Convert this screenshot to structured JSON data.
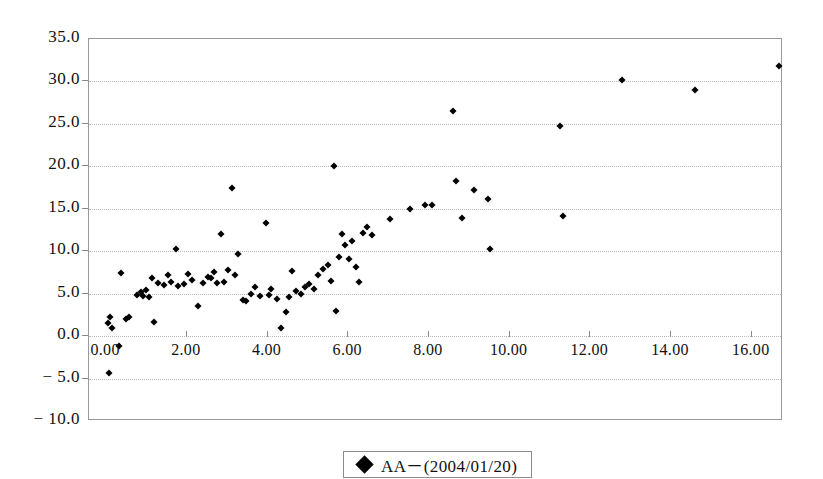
{
  "chart_data": {
    "type": "scatter",
    "title": "",
    "xlabel": "",
    "ylabel": "",
    "xlim": [
      -0.4,
      16.8
    ],
    "ylim": [
      -10.0,
      35.0
    ],
    "grid": true,
    "legend_position": "bottom-center",
    "x_ticks": [
      "0.00",
      "2.00",
      "4.00",
      "6.00",
      "8.00",
      "10.00",
      "12.00",
      "14.00",
      "16.00"
    ],
    "x_tick_values": [
      0,
      2,
      4,
      6,
      8,
      10,
      12,
      14,
      16
    ],
    "y_ticks": [
      "35.0",
      "30.0",
      "25.0",
      "20.0",
      "15.0",
      "10.0",
      "5.0",
      "0.0",
      "− 5.0",
      "− 10.0"
    ],
    "y_tick_values": [
      35,
      30,
      25,
      20,
      15,
      10,
      5,
      0,
      -5,
      -10
    ],
    "marker": "diamond",
    "marker_color": "#000000",
    "grid_color": "#b9b9b9",
    "frame_color": "#9a9a9a",
    "series": [
      {
        "name": "AA－(2004/01/20)",
        "points": [
          [
            0.08,
            1.6
          ],
          [
            0.12,
            2.2
          ],
          [
            0.1,
            -4.4
          ],
          [
            0.18,
            0.9
          ],
          [
            0.35,
            -1.2
          ],
          [
            0.4,
            7.4
          ],
          [
            0.52,
            2.0
          ],
          [
            0.58,
            2.3
          ],
          [
            0.8,
            4.9
          ],
          [
            0.88,
            5.2
          ],
          [
            0.95,
            4.7
          ],
          [
            1.02,
            5.4
          ],
          [
            1.08,
            4.6
          ],
          [
            1.15,
            6.9
          ],
          [
            1.22,
            1.7
          ],
          [
            1.3,
            6.2
          ],
          [
            1.45,
            6.0
          ],
          [
            1.55,
            7.2
          ],
          [
            1.62,
            6.4
          ],
          [
            1.75,
            10.3
          ],
          [
            1.8,
            5.9
          ],
          [
            1.95,
            6.1
          ],
          [
            2.05,
            7.3
          ],
          [
            2.15,
            6.6
          ],
          [
            2.3,
            3.5
          ],
          [
            2.42,
            6.3
          ],
          [
            2.55,
            7.0
          ],
          [
            2.62,
            6.9
          ],
          [
            2.7,
            7.5
          ],
          [
            2.78,
            6.2
          ],
          [
            2.88,
            12.0
          ],
          [
            2.95,
            6.4
          ],
          [
            3.05,
            7.8
          ],
          [
            3.15,
            17.5
          ],
          [
            3.22,
            7.2
          ],
          [
            3.3,
            9.7
          ],
          [
            3.42,
            4.3
          ],
          [
            3.5,
            4.1
          ],
          [
            3.62,
            5.0
          ],
          [
            3.72,
            5.8
          ],
          [
            3.85,
            4.7
          ],
          [
            3.98,
            13.3
          ],
          [
            4.05,
            4.8
          ],
          [
            4.12,
            5.5
          ],
          [
            4.25,
            4.4
          ],
          [
            4.35,
            0.9
          ],
          [
            4.48,
            2.8
          ],
          [
            4.55,
            4.6
          ],
          [
            4.62,
            7.7
          ],
          [
            4.72,
            5.3
          ],
          [
            4.85,
            5.0
          ],
          [
            4.95,
            5.8
          ],
          [
            5.05,
            6.1
          ],
          [
            5.18,
            5.6
          ],
          [
            5.28,
            7.2
          ],
          [
            5.4,
            7.9
          ],
          [
            5.52,
            8.4
          ],
          [
            5.6,
            6.5
          ],
          [
            5.68,
            20.0
          ],
          [
            5.72,
            2.9
          ],
          [
            5.8,
            9.3
          ],
          [
            5.88,
            12.0
          ],
          [
            5.95,
            10.7
          ],
          [
            6.05,
            9.1
          ],
          [
            6.12,
            11.2
          ],
          [
            6.22,
            8.2
          ],
          [
            6.3,
            6.4
          ],
          [
            6.38,
            12.2
          ],
          [
            6.48,
            12.8
          ],
          [
            6.62,
            11.9
          ],
          [
            7.05,
            13.8
          ],
          [
            7.55,
            15.0
          ],
          [
            7.92,
            15.5
          ],
          [
            8.1,
            15.4
          ],
          [
            8.62,
            26.5
          ],
          [
            8.7,
            18.3
          ],
          [
            8.85,
            13.9
          ],
          [
            9.15,
            17.2
          ],
          [
            9.48,
            16.2
          ],
          [
            9.55,
            10.3
          ],
          [
            11.28,
            24.8
          ],
          [
            11.35,
            14.2
          ],
          [
            12.8,
            30.2
          ],
          [
            14.62,
            29.0
          ],
          [
            16.7,
            31.8
          ]
        ]
      }
    ]
  },
  "legend": {
    "entries": [
      {
        "label": "AA－(2004/01/20)",
        "marker": "diamond-marker"
      }
    ]
  }
}
